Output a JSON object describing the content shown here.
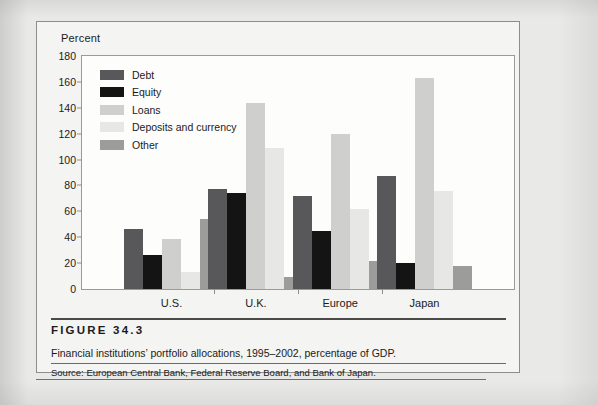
{
  "figure": {
    "number_label": "FIGURE 34.3",
    "caption": "Financial institutions’ portfolio allocations, 1995–2002, percentage of GDP.",
    "source": "Source: European Central Bank, Federal Reserve Board, and Bank of Japan."
  },
  "chart_data": {
    "type": "bar",
    "title": "",
    "subtitle": "",
    "xlabel": "",
    "ylabel": "Percent",
    "ylim": [
      0,
      180
    ],
    "yticks": [
      0,
      20,
      40,
      60,
      80,
      100,
      120,
      140,
      160,
      180
    ],
    "ytick_labels": [
      "0",
      "20",
      "40",
      "60",
      "80",
      "100",
      "120",
      "140",
      "160",
      "180"
    ],
    "grid": false,
    "legend_position": "upper-left-inside",
    "categories": [
      "U.S.",
      "U.K.",
      "Europe",
      "Japan"
    ],
    "series": [
      {
        "name": "Debt",
        "color": "#58585a",
        "values": [
          46,
          77,
          72,
          87
        ]
      },
      {
        "name": "Equity",
        "color": "#141414",
        "values": [
          26,
          74,
          45,
          20
        ]
      },
      {
        "name": "Loans",
        "color": "#cfcfcd",
        "values": [
          39,
          144,
          120,
          163
        ]
      },
      {
        "name": "Deposits and currency",
        "color": "#e7e7e5",
        "values": [
          13,
          109,
          62,
          76
        ]
      },
      {
        "name": "Other",
        "color": "#9c9c9a",
        "values": [
          54,
          9,
          22,
          18
        ]
      }
    ]
  }
}
